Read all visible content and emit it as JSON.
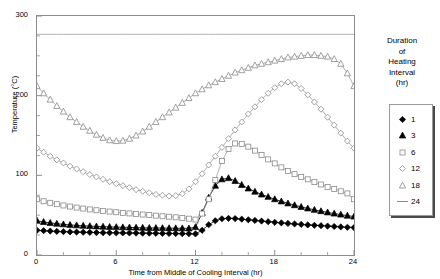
{
  "title": "",
  "axes": {
    "x": {
      "label": "Time from Middle of Cooling Interval (hr)",
      "ticks": [
        "0",
        "6",
        "12",
        "18",
        "24"
      ],
      "min": 0,
      "max": 24
    },
    "y": {
      "label": "Temperature (°C)",
      "ticks": [
        "0",
        "100",
        "200",
        "300"
      ],
      "min": 0,
      "max": 300
    }
  },
  "legend": {
    "title_lines": [
      "Duration",
      "of",
      "Heating",
      "Interval",
      "(hr)"
    ],
    "title": "Duration of Heating Interval (hr)",
    "items": [
      {
        "label": "1",
        "marker": "filled-diamond"
      },
      {
        "label": "3",
        "marker": "filled-triangle"
      },
      {
        "label": "6",
        "marker": "open-square"
      },
      {
        "label": "12",
        "marker": "open-diamond"
      },
      {
        "label": "18",
        "marker": "open-triangle"
      },
      {
        "label": "24",
        "marker": "line-dash"
      }
    ]
  },
  "chart_data": {
    "type": "line",
    "title": "",
    "xlabel": "Time from Middle of Cooling Interval (hr)",
    "ylabel": "Temperature (°C)",
    "xlim": [
      0,
      24
    ],
    "ylim": [
      0,
      300
    ],
    "grid": false,
    "legend_position": "right-outside",
    "legend_title": "Duration of Heating Interval (hr)",
    "x": [
      0,
      0.5,
      1,
      1.5,
      2,
      2.5,
      3,
      3.5,
      4,
      4.5,
      5,
      5.5,
      6,
      6.5,
      7,
      7.5,
      8,
      8.5,
      9,
      9.5,
      10,
      10.5,
      11,
      11.5,
      12,
      12.5,
      13,
      13.5,
      14,
      14.5,
      15,
      15.5,
      16,
      16.5,
      17,
      17.5,
      18,
      18.5,
      19,
      19.5,
      20,
      20.5,
      21,
      21.5,
      22,
      22.5,
      23,
      23.5,
      24
    ],
    "series": [
      {
        "name": "1",
        "marker": "filled-diamond",
        "values": [
          31,
          30.5,
          30,
          29.6,
          29.3,
          29,
          28.8,
          28.6,
          28.4,
          28.2,
          28,
          27.9,
          27.8,
          27.7,
          27.6,
          27.5,
          27.4,
          27.3,
          27.2,
          27.1,
          27,
          26.9,
          26.8,
          26.7,
          26.5,
          31,
          38,
          43,
          45.5,
          46,
          45.7,
          45,
          44.2,
          43.4,
          42.6,
          41.8,
          41,
          40.3,
          39.6,
          39,
          38.4,
          37.8,
          37.3,
          36.8,
          36.3,
          35.8,
          35.3,
          34.8,
          34.4
        ]
      },
      {
        "name": "3",
        "marker": "filled-triangle",
        "values": [
          43,
          41.5,
          40.3,
          39.3,
          38.5,
          37.8,
          37.2,
          36.7,
          36.3,
          35.9,
          35.6,
          35.3,
          35,
          34.8,
          34.6,
          34.4,
          34.2,
          34,
          33.9,
          33.8,
          33.7,
          33.6,
          33.5,
          33.4,
          35,
          53,
          72,
          87,
          95,
          96.5,
          93,
          88,
          83.5,
          79.5,
          76,
          73,
          70,
          67.3,
          64.8,
          62.5,
          60.4,
          58.5,
          56.7,
          55,
          53.5,
          52,
          50.7,
          49.4,
          48.2
        ]
      },
      {
        "name": "6",
        "marker": "open-square",
        "values": [
          70,
          67.5,
          65.5,
          63.8,
          62.2,
          60.8,
          59.5,
          58.3,
          57.2,
          56.2,
          55.3,
          54.5,
          53.7,
          52.9,
          52.2,
          51.5,
          50.8,
          50.1,
          49.4,
          48.7,
          48,
          47.3,
          46.5,
          45.6,
          44.5,
          52,
          70,
          94,
          118,
          133,
          140,
          139.5,
          136,
          131,
          125.5,
          120,
          115,
          110,
          105.5,
          101.5,
          98,
          95,
          91.5,
          88.5,
          85.5,
          82.8,
          80,
          77.3,
          70
        ]
      },
      {
        "name": "12",
        "marker": "open-diamond",
        "values": [
          134,
          129,
          124,
          119.5,
          115.5,
          111.5,
          108,
          104.5,
          101,
          98,
          95,
          92,
          89.5,
          87,
          84.5,
          82,
          80,
          78,
          76,
          75,
          74,
          74.5,
          77,
          83,
          92,
          102,
          113,
          124,
          135,
          146,
          157,
          167,
          177,
          186,
          195,
          203,
          210,
          215,
          217,
          215,
          209,
          201,
          192,
          183,
          173,
          163,
          153,
          143,
          134
        ]
      },
      {
        "name": "18",
        "marker": "open-triangle",
        "values": [
          212,
          203,
          195,
          187,
          180,
          173,
          167,
          161,
          156,
          151,
          147,
          144,
          143,
          143.5,
          146,
          150,
          155,
          161,
          167,
          173,
          179,
          185,
          191,
          197,
          203,
          208,
          213,
          217,
          221,
          225,
          229,
          232,
          235,
          238,
          240,
          242,
          244,
          246,
          248,
          249,
          250,
          251,
          251,
          250,
          249,
          246,
          240,
          228,
          212
        ]
      },
      {
        "name": "24",
        "marker": "line-dash",
        "values": [
          277,
          277,
          277,
          277,
          277,
          277,
          277,
          277,
          277,
          277,
          277,
          277,
          277,
          277,
          277,
          277,
          277,
          277,
          277,
          277,
          277,
          277,
          277,
          277,
          277,
          277,
          277,
          277,
          277,
          277,
          277,
          277,
          277,
          277,
          277,
          277,
          277,
          277,
          277,
          277,
          277,
          277,
          277,
          277,
          277,
          277,
          277,
          277,
          277
        ]
      }
    ]
  }
}
